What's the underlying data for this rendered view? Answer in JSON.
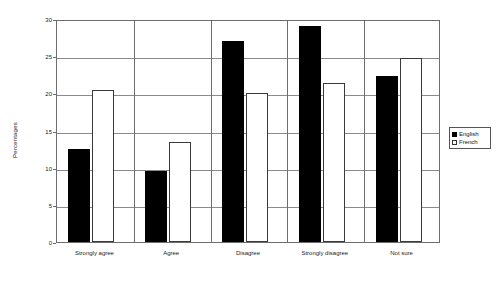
{
  "chart_data": {
    "type": "bar",
    "title": "",
    "xlabel": "",
    "ylabel": "Percentages",
    "ylim": [
      0,
      30
    ],
    "yticks": [
      0,
      5,
      10,
      15,
      20,
      25,
      30
    ],
    "grid": true,
    "legend_position": "right",
    "categories": [
      "Strongly agree",
      "Agree",
      "Disagree",
      "Strongly disagree",
      "Not sure"
    ],
    "series": [
      {
        "name": "English",
        "color": "#000000",
        "values": [
          12.5,
          9.5,
          27.0,
          29.0,
          22.3
        ]
      },
      {
        "name": "French",
        "color": "#ffffff",
        "values": [
          20.4,
          13.5,
          20.0,
          21.4,
          24.7
        ]
      }
    ]
  },
  "legend": {
    "items": [
      {
        "label": "English",
        "swatch": "filled-square-icon"
      },
      {
        "label": "French",
        "swatch": "outline-square-icon"
      }
    ]
  }
}
